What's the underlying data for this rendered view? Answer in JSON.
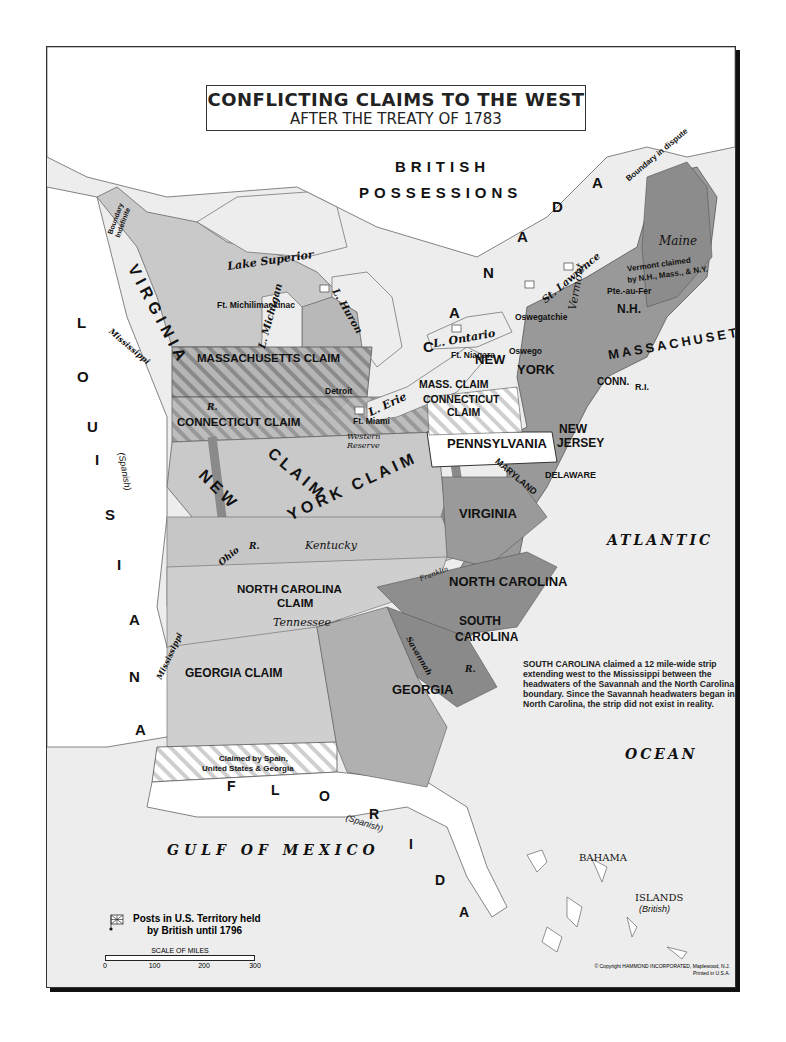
{
  "title": {
    "line1": "CONFLICTING CLAIMS TO THE WEST",
    "line2": "AFTER THE TREATY OF 1783"
  },
  "regions": {
    "british": [
      "BRITISH",
      "POSSESSIONS"
    ],
    "canada_letters": [
      "C",
      "A",
      "N",
      "A",
      "D",
      "A"
    ],
    "louisiana_letters": [
      "L",
      "O",
      "U",
      "I",
      "S",
      "I",
      "A",
      "N",
      "A"
    ],
    "louisiana_note": "(Spanish)",
    "florida_letters": [
      "F",
      "L",
      "O",
      "R",
      "I",
      "D",
      "A"
    ],
    "florida_note": "(Spanish)"
  },
  "claims": {
    "virginia_claim": "VIRGINIA",
    "massachusetts_claim": "MASSACHUSETTS CLAIM",
    "connecticut_claim": "CONNECTICUT CLAIM",
    "new_york_claim_a": "NEW",
    "new_york_claim_b": "YORK CLAIM",
    "new_york_claim_c": "CLAIM",
    "mass_claim_short": "MASS. CLAIM",
    "connecticut_claim_short_1": "CONNECTICUT",
    "connecticut_claim_short_2": "CLAIM",
    "north_carolina_claim_1": "NORTH CAROLINA",
    "north_carolina_claim_2": "CLAIM",
    "georgia_claim": "GEORGIA CLAIM",
    "spain_claim_1": "Claimed by Spain,",
    "spain_claim_2": "United States & Georgia",
    "boundary_indefinite_1": "Boundary",
    "boundary_indefinite_2": "Indefinite",
    "boundary_dispute": "Boundary in dispute",
    "vermont_claimed_1": "Vermont claimed",
    "vermont_claimed_2": "by N.H., Mass., & N.Y."
  },
  "states": {
    "new_york_1": "NEW",
    "new_york_2": "YORK",
    "pennsylvania": "PENNSYLVANIA",
    "new_jersey_1": "NEW",
    "new_jersey_2": "JERSEY",
    "delaware": "DELAWARE",
    "maryland": "MARYLAND",
    "virginia": "VIRGINIA",
    "north_carolina": "NORTH CAROLINA",
    "south_carolina_1": "SOUTH",
    "south_carolina_2": "CAROLINA",
    "georgia": "GEORGIA",
    "massachusetts": "MASSACHUSETTS",
    "mass_short": "MASSACHUSETTS",
    "nh": "N.H.",
    "conn": "CONN.",
    "ri": "R.I.",
    "vermont": "Vermont",
    "maine": "Maine",
    "kentucky": "Kentucky",
    "tennessee": "Tennessee",
    "franklin": "Franklin",
    "western_reserve_1": "Western",
    "western_reserve_2": "Reserve"
  },
  "water": {
    "lake_superior": "Lake Superior",
    "lake_michigan": "L. Michigan",
    "lake_huron": "L. Huron",
    "lake_erie": "L. Erie",
    "lake_ontario": "L. Ontario",
    "st_lawrence": "St. Lawrence",
    "mississippi_north": "Mississippi",
    "mississippi_south": "Mississippi",
    "river_r1": "R.",
    "river_r2": "R.",
    "river_r3": "R.",
    "ohio": "Ohio",
    "savannah": "Savannah",
    "atlantic": "ATLANTIC",
    "ocean": "OCEAN",
    "gulf": "GULF OF MEXICO",
    "bahama": "BAHAMA",
    "islands": "ISLANDS",
    "british_note": "(British)"
  },
  "posts": [
    {
      "name": "Ft. Michilimackinac"
    },
    {
      "name": "Detroit"
    },
    {
      "name": "Ft. Miami"
    },
    {
      "name": "Ft. Niagara"
    },
    {
      "name": "Oswego"
    },
    {
      "name": "Oswegatchie"
    },
    {
      "name": "Pte.-au-Fer"
    }
  ],
  "note": {
    "lead": "SOUTH CAROLINA",
    "text": "claimed a 12 mile-wide strip extending west to the Mississippi between the headwaters of the Savannah and the North Carolina boundary. Since the Savannah headwaters began in North Carolina, the strip did not exist in reality."
  },
  "legend": {
    "posts_label_1": "Posts in U.S. Territory held",
    "posts_label_2": "by British until 1796",
    "scale_caption": "SCALE OF MILES",
    "scale_ticks": [
      "0",
      "100",
      "200",
      "300"
    ]
  },
  "copyright": {
    "line1": "© Copyright HAMMOND INCORPORATED, Maplewood, N.J.",
    "line2": "Printed in U.S.A."
  },
  "colors": {
    "frame_bg": "#ededed",
    "land_light": "#c9c9c9",
    "land_mid": "#a9a9a9",
    "land_dark": "#8c8c8c",
    "state_white": "#ffffff",
    "ny_claim_band": "#7a7a7a",
    "water": "#ededed"
  }
}
